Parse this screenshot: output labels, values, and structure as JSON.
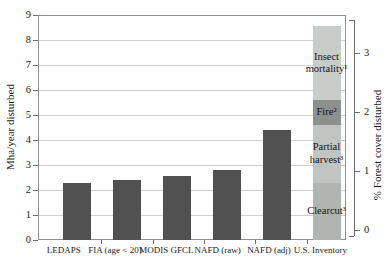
{
  "chart_data": {
    "type": "bar",
    "title": "",
    "grid": true,
    "legend": "none",
    "bar_color": "#515151",
    "y_axis": {
      "label": "Mha/year disturbed",
      "ticks": [
        0,
        1,
        2,
        3,
        4,
        5,
        6,
        7,
        8,
        9
      ],
      "ylim": [
        0,
        9
      ]
    },
    "y2_axis": {
      "label": "% Forest cover disturbed",
      "ticks": [
        0,
        1,
        2,
        3
      ],
      "ylim": [
        0,
        3.6
      ]
    },
    "categories": [
      "LEDAPS",
      "FIA (age < 20)",
      "MODIS GFCL",
      "NAFD (raw)",
      "NAFD (adj)",
      "U.S. Inventory"
    ],
    "values": [
      2.3,
      2.4,
      2.55,
      2.8,
      4.4,
      8.55
    ],
    "bars": [
      {
        "category": "LEDAPS",
        "value": 2.3
      },
      {
        "category": "FIA (age < 20)",
        "value": 2.4
      },
      {
        "category": "MODIS GFCL",
        "value": 2.55
      },
      {
        "category": "NAFD (raw)",
        "value": 2.8
      },
      {
        "category": "NAFD (adj)",
        "value": 4.4
      },
      {
        "category": "U.S. Inventory",
        "value": 8.55,
        "segments": [
          {
            "label": "Clearcut³",
            "value": 2.3,
            "color": "#b1b5b1"
          },
          {
            "label": "Partial\nharvest³",
            "value": 2.3,
            "color": "#c1c5c1"
          },
          {
            "label": "Fire²",
            "value": 1.0,
            "color": "#8d918d"
          },
          {
            "label": "Insect\nmortality¹",
            "value": 2.95,
            "color": "#c9cdc9"
          }
        ]
      }
    ]
  }
}
